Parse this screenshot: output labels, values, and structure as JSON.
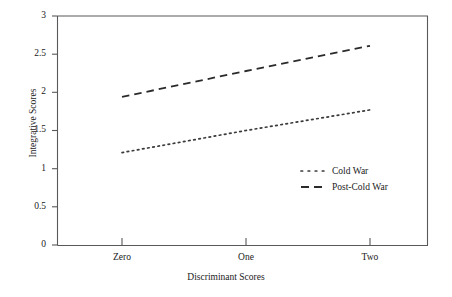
{
  "chart_data": {
    "type": "line",
    "title": "",
    "xlabel": "Discriminant Scores",
    "ylabel": "Integrative Scores",
    "categories": [
      "Zero",
      "One",
      "Two"
    ],
    "xtick_labels": [
      "Zero",
      "One",
      "Two"
    ],
    "ytick_labels": [
      "0",
      "0.5",
      "1",
      "1.5",
      "2",
      "2.5",
      "3"
    ],
    "ytick_values": [
      0,
      0.5,
      1,
      1.5,
      2,
      2.5,
      3
    ],
    "ylim": [
      0,
      3
    ],
    "grid": false,
    "legend_position": "center-right",
    "series": [
      {
        "name": "Cold War",
        "style": "dotted",
        "color": "#3b3b3b",
        "values": [
          1.21,
          1.5,
          1.77
        ]
      },
      {
        "name": "Post-Cold War",
        "style": "dashed",
        "color": "#2b2b2b",
        "values": [
          1.94,
          2.28,
          2.61
        ]
      }
    ]
  },
  "legend": {
    "items": [
      {
        "label": "Cold War",
        "marker": "dotted-line-marker"
      },
      {
        "label": "Post-Cold War",
        "marker": "dashed-line-marker"
      }
    ]
  },
  "axes": {
    "y_title": "Integrative Scores",
    "x_title": "Discriminant Scores",
    "y_labels": [
      "3",
      "2.5",
      "2",
      "1.5",
      "1",
      "0.5",
      "0"
    ],
    "x_labels": [
      "Zero",
      "One",
      "Two"
    ]
  },
  "colors": {
    "axis": "#58595b",
    "text": "#1a1a1a",
    "background": "#ffffff",
    "cold_war": "#3b3b3b",
    "post_cold_war": "#2b2b2b"
  }
}
